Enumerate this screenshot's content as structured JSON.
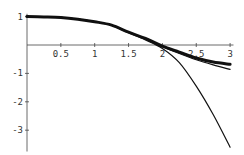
{
  "chart_data": {
    "type": "line",
    "title": "",
    "xlabel": "",
    "ylabel": "",
    "xlim": [
      0,
      3
    ],
    "ylim": [
      -3.7,
      1.1
    ],
    "grid": false,
    "legend": null,
    "x_ticks": [
      {
        "value": 0.5,
        "label": "0.5"
      },
      {
        "value": 1,
        "label": "1"
      },
      {
        "value": 1.5,
        "label": "1.5"
      },
      {
        "value": 2,
        "label": "2"
      },
      {
        "value": 2.5,
        "label": "2.5"
      },
      {
        "value": 3,
        "label": "3"
      }
    ],
    "y_ticks": [
      {
        "value": 1,
        "label": "1"
      },
      {
        "value": -1,
        "label": "-1"
      },
      {
        "value": -2,
        "label": "-2"
      },
      {
        "value": -3,
        "label": "-3"
      }
    ],
    "x": [
      0,
      0.25,
      0.5,
      0.75,
      1.0,
      1.25,
      1.5,
      1.75,
      2.0,
      2.25,
      2.5,
      2.75,
      3.0
    ],
    "series": [
      {
        "name": "thick curve",
        "stroke_width": 3,
        "values": [
          1.0,
          0.99,
          0.97,
          0.91,
          0.82,
          0.7,
          0.45,
          0.23,
          -0.04,
          -0.25,
          -0.46,
          -0.6,
          -0.68
        ]
      },
      {
        "name": "thin curve (close approximation)",
        "stroke_width": 1.2,
        "values": [
          1.0,
          0.99,
          0.97,
          0.91,
          0.82,
          0.7,
          0.45,
          0.22,
          -0.06,
          -0.3,
          -0.52,
          -0.7,
          -0.86
        ]
      },
      {
        "name": "thin curve (steep approximation)",
        "stroke_width": 1.2,
        "values": [
          1.0,
          0.99,
          0.97,
          0.91,
          0.82,
          0.69,
          0.43,
          0.18,
          -0.12,
          -0.62,
          -1.45,
          -2.45,
          -3.6
        ]
      }
    ]
  },
  "axes": {
    "origin_px": {
      "x": 27,
      "y": 45
    },
    "px_per_x": 67.7,
    "px_per_y": 28.4
  }
}
